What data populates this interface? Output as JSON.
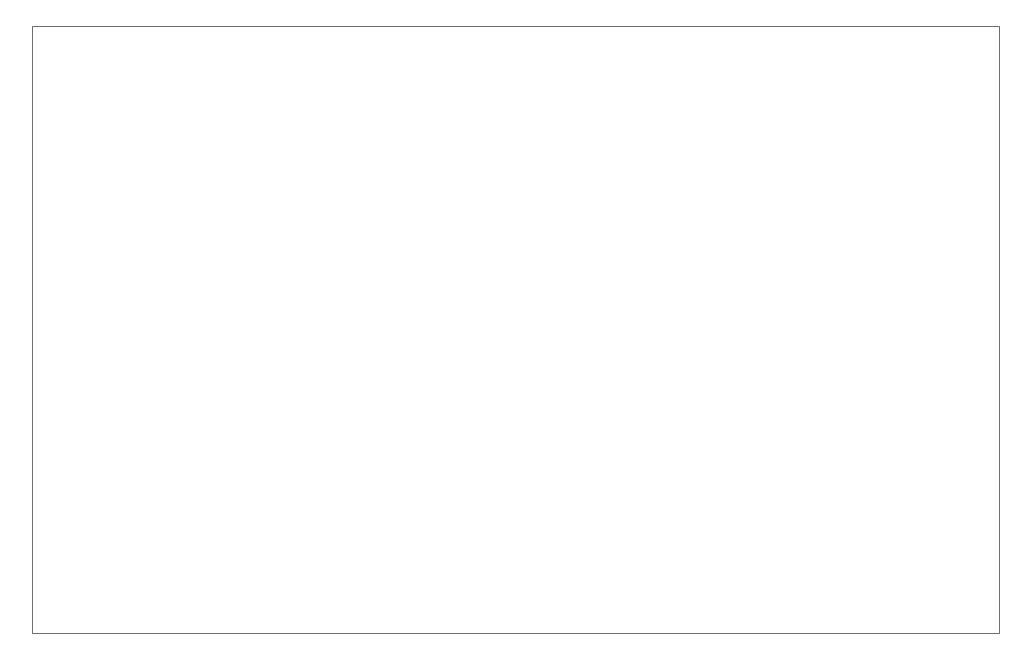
{
  "figure": {
    "background_color": "#ffffff",
    "border_color": "#6f6f6f",
    "line_color": "#3c3c3c"
  },
  "chart_data": {
    "type": "line",
    "title": "",
    "xlabel": "Year",
    "ylabel": "Thousands",
    "xlim": [
      1950,
      2001
    ],
    "ylim": [
      20000,
      120000
    ],
    "ytick_step": 20000,
    "yminor_step": 10000,
    "xtick_step": 1,
    "xlabel_step": 2,
    "grid": false,
    "legend": false,
    "ytick_labels": [
      "20,000",
      "40,000",
      "60,000",
      "80,000",
      "100,000",
      "120,000"
    ],
    "ytick_values": [
      20000,
      40000,
      60000,
      80000,
      100000,
      120000
    ],
    "xtick_labels": [
      "1950",
      "1952",
      "1954",
      "1956",
      "1958",
      "1960",
      "1962",
      "1964",
      "1966",
      "1968",
      "1970",
      "1972",
      "1974",
      "1976",
      "1978",
      "1980",
      "1982",
      "1984",
      "1986",
      "1988",
      "1990",
      "1992",
      "1994",
      "1996",
      "1998",
      "2000"
    ],
    "x": [
      1950,
      1951,
      1952,
      1953,
      1954,
      1955,
      1956,
      1957,
      1958,
      1959,
      1960,
      1961,
      1962,
      1963,
      1964,
      1965,
      1966,
      1967,
      1968,
      1969,
      1970,
      1971,
      1972,
      1973,
      1974,
      1975,
      1976,
      1977,
      1978,
      1979,
      1980,
      1981,
      1982,
      1983,
      1984,
      1985,
      1986,
      1987,
      1988,
      1989,
      1990,
      1991,
      1992,
      1993,
      1994,
      1995,
      1996,
      1997,
      1998,
      1999,
      2000
    ],
    "values": [
      27500,
      29200,
      31000,
      28800,
      25800,
      24000,
      24200,
      25800,
      27600,
      29700,
      31200,
      33000,
      34800,
      38800,
      38300,
      36000,
      38400,
      41800,
      39500,
      44700,
      56500,
      53200,
      51400,
      47700,
      50200,
      53300,
      57000,
      61000,
      60400,
      65800,
      63900,
      63600,
      70400,
      75300,
      77700,
      78100,
      78600,
      83200,
      75200,
      73400,
      74300,
      71200,
      57700,
      61200,
      58200,
      58000,
      67000,
      80000,
      92000,
      102000,
      106500
    ]
  },
  "axes": {
    "y_axis_title": "Thousands",
    "x_axis_title": "Year"
  }
}
